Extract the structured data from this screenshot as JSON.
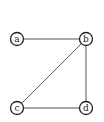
{
  "graph": {
    "nodes": [
      {
        "id": "a",
        "label": "a",
        "x": 17,
        "y": 39
      },
      {
        "id": "b",
        "label": "b",
        "x": 86,
        "y": 39
      },
      {
        "id": "c",
        "label": "c",
        "x": 17,
        "y": 108
      },
      {
        "id": "d",
        "label": "d",
        "x": 86,
        "y": 108
      }
    ],
    "edges": [
      {
        "from": "a",
        "to": "b"
      },
      {
        "from": "b",
        "to": "c"
      },
      {
        "from": "b",
        "to": "d"
      },
      {
        "from": "c",
        "to": "d"
      }
    ],
    "node_radius": 6.5,
    "colors": {
      "node_stroke": "#222222",
      "edge": "#555555",
      "background": "#ffffff"
    }
  }
}
